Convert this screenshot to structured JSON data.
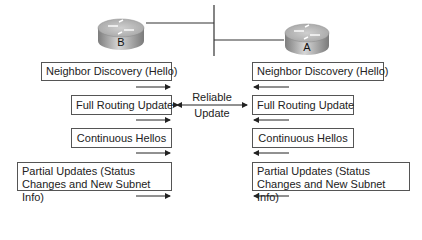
{
  "routers": {
    "left": {
      "label": "B"
    },
    "right": {
      "label": "A"
    }
  },
  "left_column": [
    {
      "text": "Neighbor Discovery (Hello)",
      "arrow_direction": "right"
    },
    {
      "text": "Full Routing Update",
      "arrow_direction": "right"
    },
    {
      "text": "Continuous Hellos",
      "arrow_direction": "right"
    },
    {
      "text": "Partial Updates (Status Changes and New Subnet Info)",
      "arrow_direction": "right"
    }
  ],
  "right_column": [
    {
      "text": "Neighbor Discovery (Hello)",
      "arrow_direction": "left"
    },
    {
      "text": "Full Routing Update",
      "arrow_direction": "left"
    },
    {
      "text": "Continuous Hellos",
      "arrow_direction": "left"
    },
    {
      "text": "Partial Updates (Status Changes and New Subnet Info)",
      "arrow_direction": "left"
    }
  ],
  "center_label": {
    "line1": "Reliable",
    "line2": "Update"
  },
  "colors": {
    "line": "#333333",
    "router_top": "#b5b5b5",
    "router_side": "#9a9a9a"
  }
}
